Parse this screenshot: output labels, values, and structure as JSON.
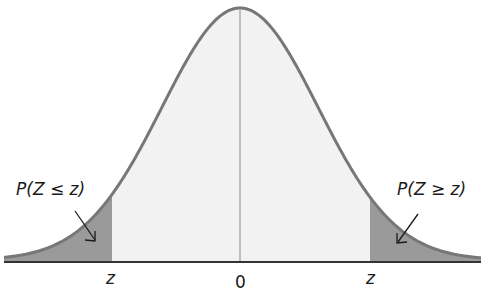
{
  "diagram": {
    "type": "normal-distribution-tails",
    "labels": {
      "left_prob": "P(Z ≤ z)",
      "right_prob": "P(Z ≥ z)",
      "left_z": "z",
      "center": "0",
      "right_z": "z"
    },
    "colors": {
      "curve": "#777777",
      "tail_fill": "#9a9a9a",
      "center_fill": "#f2f2f2",
      "axis": "#333333",
      "center_line": "#888888"
    }
  }
}
